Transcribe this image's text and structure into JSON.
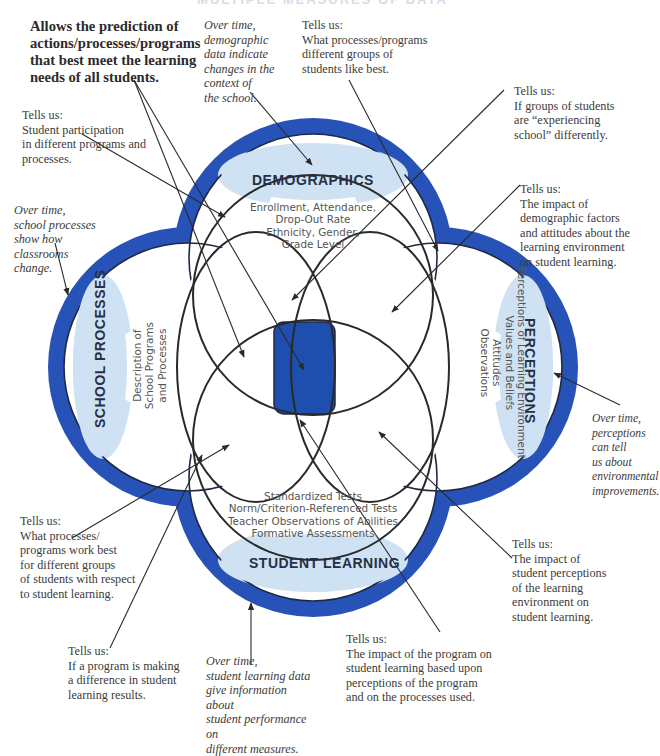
{
  "title": "MULTIPLE MEASURES OF DATA",
  "colors": {
    "ring_blue": "#2752b8",
    "center_blue": "#1f4fae",
    "lens_light_blue": "#cfe2f3",
    "line": "#2a2a2a",
    "text": "#3b3b3b"
  },
  "measures": {
    "demographics": {
      "label": "DEMOGRAPHICS",
      "description": "Enrollment, Attendance,\nDrop-Out Rate\nEthnicity, Gender,\nGrade Level"
    },
    "school_processes": {
      "label": "SCHOOL PROCESSES",
      "description": "Description of\nSchool Programs\nand Processes"
    },
    "perceptions": {
      "label": "PERCEPTIONS",
      "description": "Perceptions of Learning Environment\nValues and Beliefs\nAttitudes\nObservations"
    },
    "student_learning": {
      "label": "STUDENT LEARNING",
      "description": "Standardized Tests\nNorm/Criterion-Referenced Tests\nTeacher Observations of Abilities\nFormative Assessments"
    }
  },
  "annotations": {
    "center": "Allows the prediction of\nactions/processes/programs\nthat best meet the learning\nneeds of all students.",
    "demographics_over_time": "Over time,\ndemographic\ndata indicate\nchanges in the\ncontext of\nthe school.",
    "demo_perceptions": "Tells us:\nWhat processes/programs\ndifferent groups of\nstudents like best.",
    "demo_processes": "Tells us:\nStudent participation\nin different programs and\nprocesses.",
    "demo_perc_proc": "Tells us:\nIf groups of students\nare “experiencing\nschool” differently.",
    "demo_perc_impact": "Tells us:\nThe impact of\ndemographic factors\nand attitudes about the\nlearning environment\non student learning.",
    "processes_over_time": "Over time,\nschool processes\nshow how\nclassrooms\nchange.",
    "perceptions_over_time": "Over time,\nperceptions\ncan tell\nus about\nenvironmental\nimprovements.",
    "processes_learning_groups": "Tells us:\nWhat processes/\nprograms work best\nfor different groups\nof students with respect\nto student learning.",
    "perceptions_learning": "Tells us:\nThe impact of\nstudent perceptions\nof the learning\nenvironment on\nstudent learning.",
    "processes_learning": "Tells us:\nIf a program is making\na difference in student\nlearning results.",
    "learning_over_time": "Over time,\nstudent learning data\ngive information about\nstudent performance on\ndifferent measures.",
    "perc_proc_learning": "Tells us:\nThe impact of the program on\nstudent learning based upon\nperceptions of the program\nand on the processes used."
  }
}
